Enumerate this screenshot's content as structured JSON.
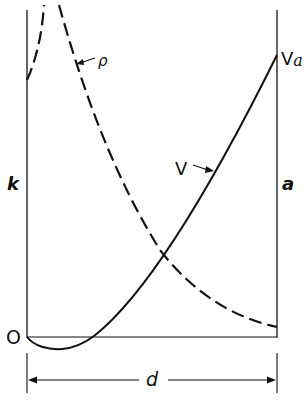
{
  "diagram": {
    "type": "potential-and-charge-density-profile",
    "labels": {
      "rho": "ρ",
      "v_a": "V",
      "v_a_sub": "a",
      "v": "V",
      "k": "k",
      "a": "a",
      "origin": "O",
      "d": "d"
    },
    "curves": [
      {
        "name": "V",
        "style": "solid",
        "description": "potential: dips slightly below zero near k, then rises to V_a at a"
      },
      {
        "name": "ρ",
        "style": "dashed",
        "description": "charge density: large near k, decreasing toward a"
      }
    ],
    "colors": {
      "ink": "#111111",
      "background": "#ffffff"
    }
  }
}
